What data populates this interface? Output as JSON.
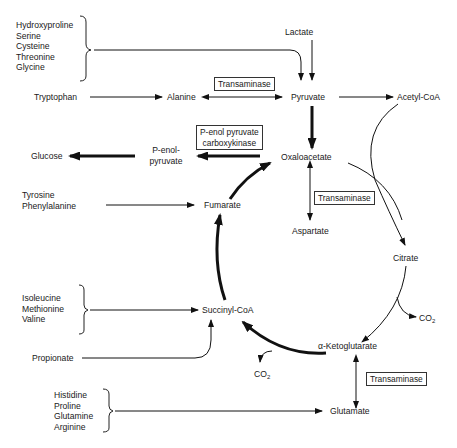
{
  "diagram": {
    "type": "metabolic-pathway",
    "groups": {
      "group1": [
        "Hydroxyproline",
        "Serine",
        "Cysteine",
        "Threonine",
        "Glycine"
      ],
      "group_aromatic": [
        "Tyrosine",
        "Phenylalanine"
      ],
      "group_succinyl": [
        "Isoleucine",
        "Methionine",
        "Valine"
      ],
      "group_glutamate": [
        "Histidine",
        "Proline",
        "Glutamine",
        "Arginine"
      ]
    },
    "nodes": {
      "lactate": "Lactate",
      "tryptophan": "Tryptophan",
      "alanine": "Alanine",
      "pyruvate": "Pyruvate",
      "acetyl_coa": "Acetyl-CoA",
      "glucose": "Glucose",
      "penol_line1": "P-enol-",
      "penol_line2": "pyruvate",
      "oxaloacetate": "Oxaloacetate",
      "fumarate": "Fumarate",
      "aspartate": "Aspartate",
      "citrate": "Citrate",
      "succinyl_coa": "Succinyl-CoA",
      "propionate": "Propionate",
      "ketoglutarate": "α-Ketoglutarate",
      "glutamate": "Glutamate",
      "co2_label": "CO",
      "co2_sub": "2"
    },
    "enzymes": {
      "transaminase_alanine": "Transaminase",
      "pepck_line1": "P-enol pyruvate",
      "pepck_line2": "carboxykinase",
      "transaminase_aspartate": "Transaminase",
      "transaminase_glutamate": "Transaminase"
    },
    "edges": [
      {
        "from": "group1",
        "to": "Pyruvate"
      },
      {
        "from": "Lactate",
        "to": "Pyruvate"
      },
      {
        "from": "Tryptophan",
        "to": "Alanine"
      },
      {
        "from": "Alanine",
        "to": "Pyruvate",
        "bidirectional": true,
        "enzyme": "Transaminase"
      },
      {
        "from": "Pyruvate",
        "to": "Acetyl-CoA"
      },
      {
        "from": "Pyruvate",
        "to": "Oxaloacetate",
        "bold": true
      },
      {
        "from": "Oxaloacetate",
        "to": "P-enol-pyruvate",
        "bold": true,
        "enzyme": "P-enol pyruvate carboxykinase"
      },
      {
        "from": "P-enol-pyruvate",
        "to": "Glucose",
        "bold": true
      },
      {
        "from": "Oxaloacetate",
        "to": "Aspartate",
        "bidirectional": true,
        "enzyme": "Transaminase"
      },
      {
        "from": "Acetyl-CoA",
        "to": "Citrate"
      },
      {
        "from": "Oxaloacetate",
        "to": "Citrate"
      },
      {
        "from": "Citrate",
        "to": "α-Ketoglutarate"
      },
      {
        "from": "Citrate",
        "to": "CO2"
      },
      {
        "from": "α-Ketoglutarate",
        "to": "Succinyl-CoA",
        "bold": true
      },
      {
        "from": "α-Ketoglutarate",
        "to": "CO2"
      },
      {
        "from": "Succinyl-CoA",
        "to": "Fumarate",
        "bold": true
      },
      {
        "from": "Fumarate",
        "to": "Oxaloacetate",
        "bold": true
      },
      {
        "from": "Tyrosine/Phenylalanine",
        "to": "Fumarate"
      },
      {
        "from": "group_succinyl",
        "to": "Succinyl-CoA"
      },
      {
        "from": "Propionate",
        "to": "Succinyl-CoA"
      },
      {
        "from": "α-Ketoglutarate",
        "to": "Glutamate",
        "bidirectional": true,
        "enzyme": "Transaminase"
      },
      {
        "from": "group_glutamate",
        "to": "Glutamate"
      }
    ]
  }
}
